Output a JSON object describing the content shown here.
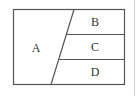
{
  "diagram": {
    "type": "partitioned-rectangle",
    "regions": [
      {
        "id": "A",
        "label": "A"
      },
      {
        "id": "B",
        "label": "B"
      },
      {
        "id": "C",
        "label": "C"
      },
      {
        "id": "D",
        "label": "D"
      }
    ],
    "colors": {
      "stroke": "#555555",
      "text": "#333333",
      "side_rule": "#cfcfcf",
      "background": "#ffffff"
    }
  }
}
